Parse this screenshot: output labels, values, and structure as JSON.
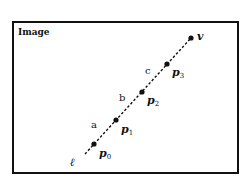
{
  "frame": {
    "title": "Image",
    "border_color": "#111111",
    "rect": {
      "x": 13,
      "y": 22,
      "width": 225,
      "height": 151
    }
  },
  "line": {
    "label": "ℓ",
    "style": "dashed",
    "start": {
      "x": 85,
      "y": 154
    },
    "end": {
      "x": 191,
      "y": 38
    }
  },
  "points": [
    {
      "name": "p",
      "sub": "0",
      "x": 94,
      "y": 144
    },
    {
      "name": "p",
      "sub": "1",
      "x": 116,
      "y": 120
    },
    {
      "name": "p",
      "sub": "2",
      "x": 142,
      "y": 92
    },
    {
      "name": "p",
      "sub": "3",
      "x": 167,
      "y": 64
    }
  ],
  "vanishing_point": {
    "label": "v",
    "x": 191,
    "y": 38
  },
  "segments": [
    {
      "label": "a",
      "x": 91,
      "y": 128
    },
    {
      "label": "b",
      "x": 119,
      "y": 101
    },
    {
      "label": "c",
      "x": 145,
      "y": 74
    }
  ]
}
